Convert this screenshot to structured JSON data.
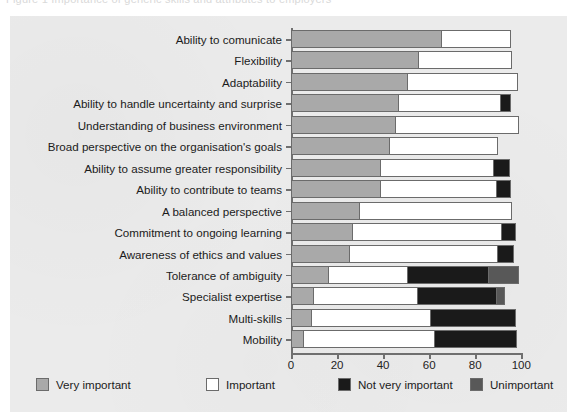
{
  "figure": {
    "ghost_caption": "Figure 1  Importance of generic skills and attributes to employers",
    "background_color": "#ebebeb"
  },
  "colors": {
    "very_important": "#a9a9a9",
    "important": "#ffffff",
    "not_very_important": "#1a1a1a",
    "unimportant": "#585858",
    "outline": "#6b6b6b",
    "axis": "#6f6f6f",
    "text": "#1b1b1b"
  },
  "legend": {
    "position": "bottom",
    "items": [
      {
        "label": "Very important",
        "color_key": "very_important",
        "color": "#a9a9a9"
      },
      {
        "label": "Important",
        "color_key": "important",
        "color": "#ffffff"
      },
      {
        "label": "Not very important",
        "color_key": "not_very_important",
        "color": "#1a1a1a"
      },
      {
        "label": "Unimportant",
        "color_key": "unimportant",
        "color": "#585858"
      }
    ]
  },
  "chart_data": {
    "type": "bar",
    "orientation": "horizontal",
    "stacked": true,
    "title": "",
    "xlabel": "",
    "ylabel": "",
    "xlim": [
      0,
      100
    ],
    "grid": false,
    "legend_position": "bottom",
    "xticks": [
      0,
      20,
      40,
      60,
      80,
      100
    ],
    "xticklabels": [
      "0",
      "20",
      "40",
      "60",
      "80",
      "100"
    ],
    "categories": [
      "Ability to comunicate",
      "Flexibility",
      "Adaptability",
      "Ability to handle uncertainty and surprise",
      "Understanding of business environment",
      "Broad perspective on the organisation's goals",
      "Ability to assume greater responsibility",
      "Ability to contribute to teams",
      "A balanced perspective",
      "Commitment to ongoing learning",
      "Awareness of ethics and values",
      "Tolerance of ambiguity",
      "Specialist expertise",
      "Multi-skills",
      "Mobility"
    ],
    "series": [
      {
        "name": "Very important",
        "color": "#a9a9a9",
        "values": [
          65.5,
          55.5,
          51,
          47,
          45.5,
          43,
          39,
          39,
          30,
          27,
          25.5,
          16.5,
          10,
          9,
          5.5
        ]
      },
      {
        "name": "Important",
        "color": "#ffffff",
        "values": [
          30,
          40.5,
          47.5,
          44,
          53.5,
          47,
          49,
          50.5,
          66,
          64.5,
          64.5,
          34.5,
          45,
          52,
          57
        ]
      },
      {
        "name": "Not very important",
        "color": "#1a1a1a",
        "values": [
          0,
          0,
          0,
          4.5,
          0,
          0,
          7,
          6,
          0,
          6,
          7,
          35,
          34.5,
          36.5,
          35.5
        ]
      },
      {
        "name": "Unimportant",
        "color": "#585858",
        "values": [
          0,
          0,
          0,
          0,
          0,
          0,
          0,
          0,
          0,
          0,
          0,
          13,
          3.5,
          0,
          0
        ]
      }
    ]
  }
}
